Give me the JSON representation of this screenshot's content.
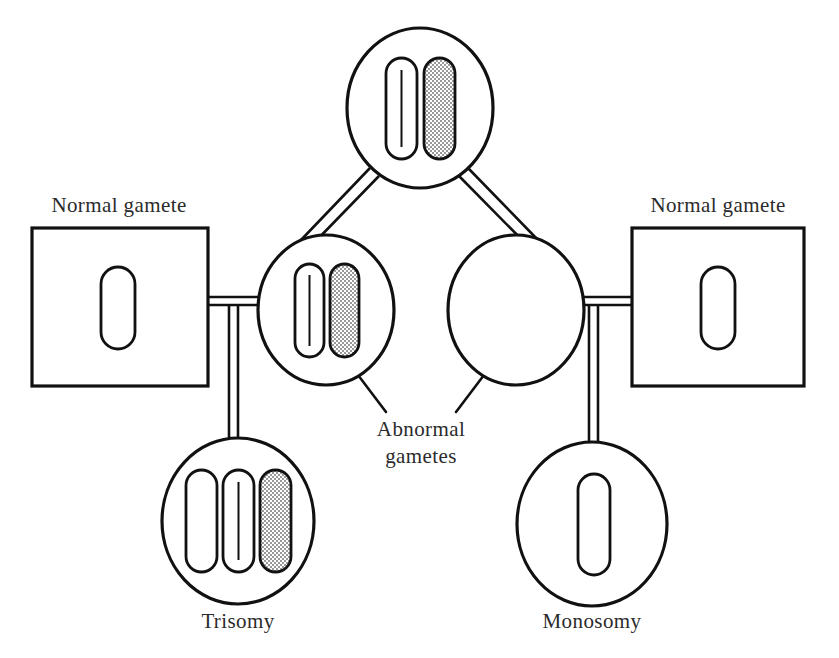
{
  "figure": {
    "background_color": "#ffffff",
    "ink_color": "#111111",
    "shade_color": "#c9c9c9",
    "width": 839,
    "height": 658
  },
  "labels": {
    "normal_gamete_left": "Normal gamete",
    "normal_gamete_right": "Normal gamete",
    "abnormal_gametes_line1": "Abnormal",
    "abnormal_gametes_line2": "gametes",
    "trisomy": "Trisomy",
    "monosomy": "Monosomy"
  },
  "cells": [
    {
      "id": "parent-cell",
      "name": "parent-cell",
      "shape": "circle",
      "cx": 420,
      "cy": 108,
      "rx": 73,
      "ry": 80,
      "chromosome_count": 2,
      "chromosomes": [
        {
          "fill": "white",
          "centerline": true
        },
        {
          "fill": "shaded",
          "centerline": false
        }
      ]
    },
    {
      "id": "abnormal-gamete-left",
      "name": "abnormal-gamete-left-cell",
      "shape": "circle",
      "cx": 326,
      "cy": 310,
      "rx": 68,
      "ry": 75,
      "chromosome_count": 2,
      "chromosomes": [
        {
          "fill": "white",
          "centerline": true
        },
        {
          "fill": "shaded",
          "centerline": false
        }
      ]
    },
    {
      "id": "abnormal-gamete-right",
      "name": "abnormal-gamete-right-cell",
      "shape": "circle",
      "cx": 516,
      "cy": 310,
      "rx": 68,
      "ry": 75,
      "chromosome_count": 0,
      "chromosomes": []
    },
    {
      "id": "trisomy-cell",
      "name": "trisomy-cell",
      "shape": "circle",
      "cx": 238,
      "cy": 521,
      "rx": 76,
      "ry": 83,
      "chromosome_count": 3,
      "chromosomes": [
        {
          "fill": "white",
          "centerline": false
        },
        {
          "fill": "white",
          "centerline": true
        },
        {
          "fill": "shaded",
          "centerline": false
        }
      ]
    },
    {
      "id": "monosomy-cell",
      "name": "monosomy-cell",
      "shape": "circle",
      "cx": 592,
      "cy": 524,
      "rx": 75,
      "ry": 82,
      "chromosome_count": 1,
      "chromosomes": [
        {
          "fill": "white",
          "centerline": false
        }
      ]
    }
  ],
  "gamete_boxes": [
    {
      "id": "normal-gamete-box-left",
      "name": "normal-gamete-box-left",
      "x": 32,
      "y": 228,
      "width": 176,
      "height": 158,
      "chromosome_count": 1,
      "label": "Normal gamete"
    },
    {
      "id": "normal-gamete-box-right",
      "name": "normal-gamete-box-right",
      "x": 632,
      "y": 228,
      "width": 172,
      "height": 158,
      "chromosome_count": 1,
      "label": "Normal gamete"
    }
  ],
  "legend": {
    "white_chromosome": "unshaded chromosome",
    "shaded_chromosome": "shaded chromosome"
  }
}
